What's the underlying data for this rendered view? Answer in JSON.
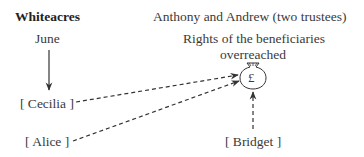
{
  "diagram": {
    "left": {
      "heading": "Whiteacres",
      "owner": "June",
      "beneficiaries": [
        "[ Cecilia ]",
        "[ Alice ]"
      ]
    },
    "right": {
      "heading": "Anthony and Andrew (two trustees)",
      "note_line1": "Rights of the beneficiaries",
      "note_line2": "overreached",
      "money_symbol": "£",
      "beneficiary": "[ Bridget ]"
    },
    "icons": {
      "money_bag": "money-bag-icon",
      "solid_arrow": "arrow-down-icon",
      "dashed_arrows": "dashed-arrow-icon"
    },
    "colors": {
      "text": "#3a3a3a",
      "lines": "#333333"
    }
  }
}
